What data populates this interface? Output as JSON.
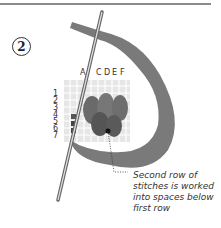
{
  "step": {
    "number": "2"
  },
  "grid": {
    "column_labels": [
      "A",
      "C",
      "D",
      "E",
      "F"
    ],
    "row_labels": [
      "1",
      "2",
      "3",
      "4",
      "5",
      "6",
      "7"
    ]
  },
  "callout": {
    "text_lines": [
      "Second row of",
      "stitches is worked",
      "into spaces below",
      "first row"
    ]
  }
}
